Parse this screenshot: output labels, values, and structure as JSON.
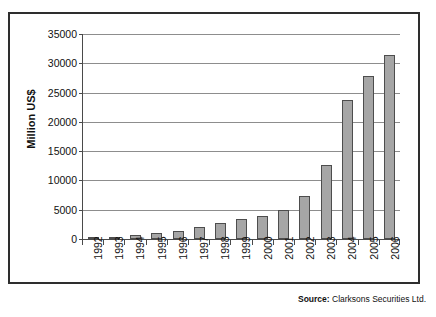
{
  "figure": {
    "y_axis_title": "Million US$"
  },
  "source": {
    "prefix": "Source:",
    "text": " Clarksons Securities Ltd."
  },
  "chart_data": {
    "type": "bar",
    "title": "",
    "xlabel": "",
    "ylabel": "Million US$",
    "ylim": [
      0,
      35000
    ],
    "ytick_step": 5000,
    "yticks": [
      0,
      5000,
      10000,
      15000,
      20000,
      25000,
      30000,
      35000
    ],
    "ytick_labels": [
      "0",
      "5000",
      "10000",
      "15000",
      "20000",
      "25000",
      "30000",
      "35000"
    ],
    "grid": true,
    "legend": false,
    "bar_color": "#a6a6a6",
    "bar_edge_color": "#4d4d4d",
    "categories": [
      "1992",
      "1993",
      "1994",
      "1995",
      "1996",
      "1997",
      "1998",
      "1999",
      "2000",
      "2001",
      "2002",
      "2003",
      "2004",
      "2005",
      "2006"
    ],
    "values": [
      150,
      380,
      700,
      1050,
      1400,
      2000,
      2800,
      3350,
      3900,
      4900,
      7300,
      12700,
      23800,
      27800,
      31400
    ]
  }
}
